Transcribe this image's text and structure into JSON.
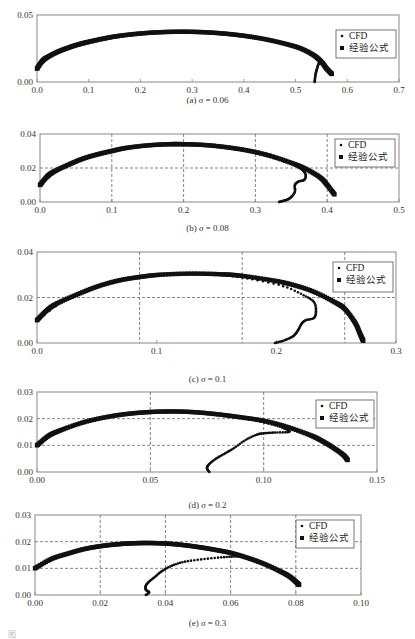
{
  "figure": {
    "footer_fragment": "图"
  },
  "chart_data": [
    {
      "id": "a",
      "type": "scatter",
      "caption_prefix": "(a) ",
      "caption_symbol": "σ",
      "caption_value": " = 0.06",
      "title": "(a) σ = 0.06",
      "xlabel": "",
      "ylabel": "",
      "xlim": [
        0,
        0.7
      ],
      "ylim": [
        0,
        0.05
      ],
      "xticks": [
        "0.0",
        "0.1",
        "0.2",
        "0.3",
        "0.4",
        "0.5",
        "0.6",
        "0.7"
      ],
      "yticks": [
        "0.00",
        "0.05"
      ],
      "xgrid": [],
      "ygrid": [],
      "box": {
        "x": 37,
        "y": 15,
        "w": 362,
        "h": 67
      },
      "caption_y": 95,
      "legend": {
        "x": 336,
        "y": 30,
        "w": 60,
        "h": 28,
        "entries": [
          "CFD",
          "经验公式"
        ]
      },
      "series": [
        {
          "name": "经验公式",
          "marker": "square",
          "x": [
            0.0,
            0.01,
            0.02,
            0.04,
            0.06,
            0.08,
            0.1,
            0.13,
            0.16,
            0.2,
            0.24,
            0.28,
            0.32,
            0.36,
            0.4,
            0.44,
            0.48,
            0.51,
            0.535,
            0.55,
            0.56,
            0.57
          ],
          "y": [
            0.01,
            0.0155,
            0.0185,
            0.0225,
            0.0255,
            0.028,
            0.03,
            0.0325,
            0.0345,
            0.0362,
            0.0372,
            0.0375,
            0.0372,
            0.0362,
            0.0345,
            0.032,
            0.0285,
            0.025,
            0.02,
            0.015,
            0.01,
            0.006
          ]
        },
        {
          "name": "CFD",
          "marker": "dot",
          "x": [
            0.0,
            0.02,
            0.05,
            0.1,
            0.15,
            0.2,
            0.25,
            0.3,
            0.35,
            0.4,
            0.45,
            0.5,
            0.53,
            0.545,
            0.543,
            0.54,
            0.538,
            0.537
          ],
          "y": [
            0.01,
            0.0175,
            0.024,
            0.029,
            0.033,
            0.0355,
            0.037,
            0.0372,
            0.036,
            0.034,
            0.031,
            0.026,
            0.021,
            0.016,
            0.012,
            0.008,
            0.004,
            0.0
          ]
        }
      ]
    },
    {
      "id": "b",
      "type": "scatter",
      "caption_prefix": "(b) ",
      "caption_symbol": "σ",
      "caption_value": " = 0.08",
      "title": "(b) σ = 0.08",
      "xlabel": "",
      "ylabel": "",
      "xlim": [
        0,
        0.5
      ],
      "ylim": [
        0,
        0.04
      ],
      "xticks": [
        "0.0",
        "0.1",
        "0.2",
        "0.3",
        "0.4",
        "0.5"
      ],
      "yticks": [
        "0.00",
        "0.02",
        "0.04"
      ],
      "xgrid": [
        0.1,
        0.2,
        0.3,
        0.4
      ],
      "ygrid": [
        0.02
      ],
      "box": {
        "x": 40,
        "y": 134,
        "w": 359,
        "h": 68
      },
      "caption_y": 223,
      "legend": {
        "x": 335,
        "y": 139,
        "w": 60,
        "h": 28,
        "entries": [
          "CFD",
          "经验公式"
        ]
      },
      "series": [
        {
          "name": "经验公式",
          "marker": "square",
          "x": [
            0.0,
            0.01,
            0.02,
            0.04,
            0.06,
            0.08,
            0.1,
            0.12,
            0.15,
            0.18,
            0.2,
            0.23,
            0.26,
            0.29,
            0.32,
            0.35,
            0.37,
            0.39,
            0.4,
            0.41
          ],
          "y": [
            0.01,
            0.015,
            0.018,
            0.022,
            0.0255,
            0.028,
            0.03,
            0.0318,
            0.0333,
            0.034,
            0.034,
            0.0335,
            0.0322,
            0.0302,
            0.0272,
            0.023,
            0.0195,
            0.0145,
            0.01,
            0.0045
          ]
        },
        {
          "name": "CFD",
          "marker": "dot",
          "x": [
            0.0,
            0.03,
            0.07,
            0.12,
            0.17,
            0.2,
            0.24,
            0.28,
            0.31,
            0.34,
            0.355,
            0.365,
            0.37,
            0.368,
            0.36,
            0.355,
            0.355,
            0.35,
            0.345,
            0.34,
            0.333
          ],
          "y": [
            0.01,
            0.02,
            0.027,
            0.0315,
            0.0335,
            0.0338,
            0.0332,
            0.0312,
            0.029,
            0.025,
            0.0215,
            0.019,
            0.016,
            0.013,
            0.012,
            0.01,
            0.006,
            0.003,
            0.0015,
            0.0008,
            0.0
          ]
        }
      ]
    },
    {
      "id": "c",
      "type": "scatter",
      "caption_prefix": "(c) ",
      "caption_symbol": "σ",
      "caption_value": " = 0.1",
      "title": "(c) σ = 0.1",
      "xlabel": "",
      "ylabel": "",
      "xlim": [
        0,
        0.35
      ],
      "ylim": [
        0,
        0.04
      ],
      "xticks": [
        "0.0",
        "0.1",
        "0.2",
        "0.3"
      ],
      "yticks": [
        "0.00",
        "0.02",
        "0.04"
      ],
      "xgrid": [
        0.1,
        0.2,
        0.3
      ],
      "ygrid": [
        0.02
      ],
      "box": {
        "x": 37,
        "y": 252,
        "w": 359,
        "h": 91
      },
      "caption_y": 374,
      "legend": {
        "x": 333,
        "y": 262,
        "w": 60,
        "h": 30,
        "entries": [
          "CFD",
          "经验公式"
        ]
      },
      "series": [
        {
          "name": "经验公式",
          "marker": "square",
          "x": [
            0.0,
            0.01,
            0.02,
            0.04,
            0.06,
            0.08,
            0.1,
            0.12,
            0.15,
            0.18,
            0.2,
            0.23,
            0.25,
            0.27,
            0.29,
            0.3,
            0.31,
            0.315,
            0.318
          ],
          "y": [
            0.01,
            0.0145,
            0.0175,
            0.0215,
            0.025,
            0.0275,
            0.029,
            0.03,
            0.0305,
            0.0302,
            0.0295,
            0.0275,
            0.0255,
            0.0225,
            0.018,
            0.015,
            0.009,
            0.004,
            0.001
          ]
        },
        {
          "name": "CFD",
          "marker": "dot",
          "x": [
            0.0,
            0.03,
            0.07,
            0.1,
            0.14,
            0.18,
            0.21,
            0.24,
            0.26,
            0.27,
            0.272,
            0.27,
            0.262,
            0.258,
            0.255,
            0.252,
            0.248,
            0.24,
            0.232
          ],
          "y": [
            0.01,
            0.0195,
            0.0265,
            0.0292,
            0.0302,
            0.0298,
            0.028,
            0.025,
            0.021,
            0.018,
            0.014,
            0.011,
            0.01,
            0.0085,
            0.006,
            0.004,
            0.0025,
            0.001,
            0.0
          ]
        }
      ]
    },
    {
      "id": "d",
      "type": "scatter",
      "caption_prefix": "(d) ",
      "caption_symbol": "σ",
      "caption_value": " = 0.2",
      "title": "(d) σ = 0.2",
      "xlabel": "",
      "ylabel": "",
      "xlim": [
        0,
        0.15
      ],
      "ylim": [
        0,
        0.03
      ],
      "xticks": [
        "0.00",
        "0.05",
        "0.10",
        "0.15"
      ],
      "yticks": [
        "0.00",
        "0.01",
        "0.02",
        "0.03"
      ],
      "xgrid": [
        0.05,
        0.1
      ],
      "ygrid": [
        0.01,
        0.02
      ],
      "box": {
        "x": 37,
        "y": 392,
        "w": 340,
        "h": 80
      },
      "caption_y": 500,
      "legend": {
        "x": 316,
        "y": 400,
        "w": 58,
        "h": 28,
        "entries": [
          "CFD",
          "经验公式"
        ]
      },
      "series": [
        {
          "name": "经验公式",
          "marker": "square",
          "x": [
            0.0,
            0.005,
            0.01,
            0.02,
            0.03,
            0.04,
            0.05,
            0.06,
            0.07,
            0.08,
            0.09,
            0.1,
            0.11,
            0.12,
            0.125,
            0.13,
            0.135,
            0.137
          ],
          "y": [
            0.01,
            0.0135,
            0.0155,
            0.0185,
            0.0205,
            0.0218,
            0.0225,
            0.0227,
            0.0224,
            0.0216,
            0.0205,
            0.0192,
            0.017,
            0.014,
            0.012,
            0.0095,
            0.0065,
            0.0045
          ]
        },
        {
          "name": "CFD",
          "marker": "dot",
          "x": [
            0.0,
            0.01,
            0.03,
            0.05,
            0.07,
            0.085,
            0.095,
            0.105,
            0.11,
            0.111,
            0.105,
            0.1,
            0.097,
            0.092,
            0.087,
            0.083,
            0.079,
            0.076,
            0.075,
            0.076
          ],
          "y": [
            0.01,
            0.016,
            0.0205,
            0.0222,
            0.0222,
            0.021,
            0.0195,
            0.0175,
            0.016,
            0.015,
            0.0148,
            0.0145,
            0.014,
            0.012,
            0.009,
            0.007,
            0.005,
            0.003,
            0.0015,
            0.0
          ]
        }
      ]
    },
    {
      "id": "e",
      "type": "scatter",
      "caption_prefix": "(e) ",
      "caption_symbol": "σ",
      "caption_value": " = 0.3",
      "title": "(e) σ = 0.3",
      "xlabel": "",
      "ylabel": "",
      "xlim": [
        0,
        0.1
      ],
      "ylim": [
        0,
        0.03
      ],
      "xticks": [
        "0.00",
        "0.02",
        "0.04",
        "0.06",
        "0.08",
        "0.10"
      ],
      "yticks": [
        "0.00",
        "0.01",
        "0.02",
        "0.03"
      ],
      "xgrid": [
        0.02,
        0.04,
        0.06,
        0.08
      ],
      "ygrid": [
        0.01,
        0.02
      ],
      "box": {
        "x": 35,
        "y": 515,
        "w": 326,
        "h": 80
      },
      "caption_y": 618,
      "legend": {
        "x": 296,
        "y": 520,
        "w": 58,
        "h": 28,
        "entries": [
          "CFD",
          "经验公式"
        ]
      },
      "series": [
        {
          "name": "经验公式",
          "marker": "square",
          "x": [
            0.0,
            0.005,
            0.01,
            0.015,
            0.02,
            0.025,
            0.03,
            0.035,
            0.04,
            0.045,
            0.05,
            0.055,
            0.06,
            0.065,
            0.07,
            0.075,
            0.078,
            0.08,
            0.081
          ],
          "y": [
            0.01,
            0.0135,
            0.0155,
            0.0172,
            0.0183,
            0.019,
            0.0194,
            0.0195,
            0.0193,
            0.0188,
            0.018,
            0.017,
            0.0158,
            0.014,
            0.0118,
            0.009,
            0.007,
            0.005,
            0.0038
          ]
        },
        {
          "name": "CFD",
          "marker": "dot",
          "x": [
            0.0,
            0.01,
            0.02,
            0.03,
            0.04,
            0.05,
            0.06,
            0.063,
            0.062,
            0.058,
            0.052,
            0.046,
            0.042,
            0.039,
            0.037,
            0.035,
            0.034,
            0.034,
            0.035,
            0.034
          ],
          "y": [
            0.01,
            0.0155,
            0.018,
            0.0193,
            0.0192,
            0.0178,
            0.0158,
            0.0148,
            0.0145,
            0.0142,
            0.0135,
            0.0125,
            0.011,
            0.009,
            0.007,
            0.005,
            0.0035,
            0.002,
            0.001,
            0.0
          ]
        }
      ]
    }
  ]
}
